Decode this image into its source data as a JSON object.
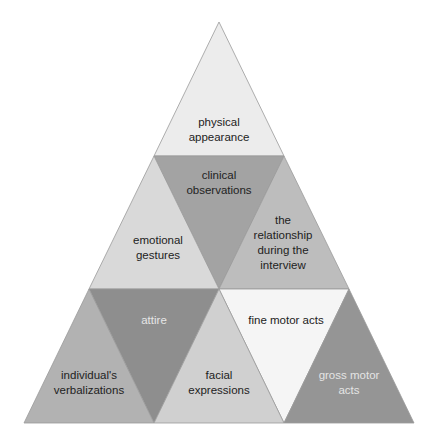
{
  "diagram": {
    "type": "triangular-pyramid-of-nine-segments",
    "triangles": [
      {
        "id": "physical-appearance",
        "label": "physical\nappearance",
        "points": "219,22 154,156 284,156",
        "fill": "#ececec",
        "text_color": "#222222",
        "label_pos": [
          219,
          130
        ]
      },
      {
        "id": "clinical-observations",
        "label": "clinical\nobservations",
        "points": "154,156 284,156 219,289",
        "fill": "#a3a3a3",
        "text_color": "#222222",
        "label_pos": [
          219,
          183
        ]
      },
      {
        "id": "emotional-gestures",
        "label": "emotional\ngestures",
        "points": "154,156 89,289 219,289",
        "fill": "#d9d9d9",
        "text_color": "#222222",
        "label_pos": [
          158,
          248
        ]
      },
      {
        "id": "relationship",
        "label": "the\nrelationship\nduring the\ninterview",
        "points": "284,156 219,289 349,289",
        "fill": "#bdbdbd",
        "text_color": "#222222",
        "label_pos": [
          283,
          243
        ]
      },
      {
        "id": "attire",
        "label": "attire",
        "points": "89,289 219,289 154,423",
        "fill": "#8e8e8e",
        "text_color": "#e6e6e6",
        "label_pos": [
          154,
          320
        ]
      },
      {
        "id": "fine-motor-acts",
        "label": "fine motor acts",
        "points": "219,289 349,289 284,423",
        "fill": "#f5f5f5",
        "text_color": "#222222",
        "label_pos": [
          286,
          320
        ]
      },
      {
        "id": "individuals-verbalizations",
        "label": "individual's\nverbalizations",
        "points": "89,289 24,423 154,423",
        "fill": "#b2b2b2",
        "text_color": "#222222",
        "label_pos": [
          89,
          383
        ]
      },
      {
        "id": "facial-expressions",
        "label": "facial\nexpressions",
        "points": "219,289 154,423 284,423",
        "fill": "#d0d0d0",
        "text_color": "#222222",
        "label_pos": [
          219,
          383
        ]
      },
      {
        "id": "gross-motor-acts",
        "label": "gross motor\nacts",
        "points": "349,289 284,423 414,423",
        "fill": "#959595",
        "text_color": "#e4e4e4",
        "label_pos": [
          349,
          383
        ]
      }
    ],
    "stroke": "#9a9a9a"
  }
}
